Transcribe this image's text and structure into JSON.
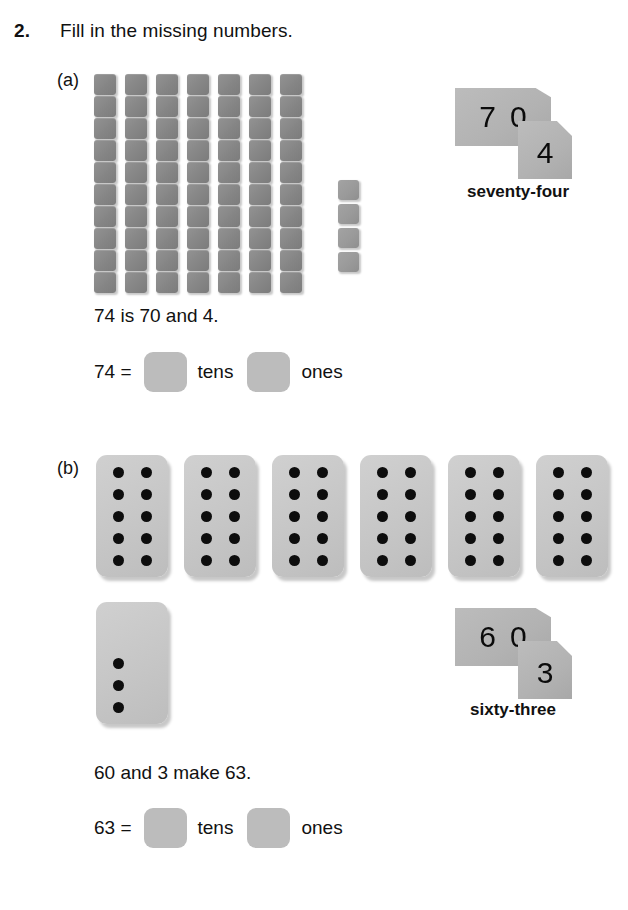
{
  "worksheet": {
    "question_number": "2.",
    "instruction": "Fill in the missing numbers."
  },
  "parts": [
    {
      "label": "(a)",
      "model_type": "base-ten-blocks",
      "tens_rods": 7,
      "cubes_per_rod": 10,
      "ones_blocks": 4,
      "number_card_tens_digit_1": "7",
      "number_card_tens_digit_2": "0",
      "number_card_ones_digit": "4",
      "number_word": "seventy-four",
      "sentence": "74 is 70 and 4.",
      "equation_lead": "74 =",
      "unit_tens": "tens",
      "unit_ones": "ones",
      "answer_tens_value": "",
      "answer_ones_value": ""
    },
    {
      "label": "(b)",
      "model_type": "ten-frame-dot-cards",
      "full_cards": 6,
      "dots_per_full_card": 10,
      "partial_card_dots": 3,
      "number_card_tens_digit_1": "6",
      "number_card_tens_digit_2": "0",
      "number_card_ones_digit": "3",
      "number_word": "sixty-three",
      "sentence": "60 and 3 make 63.",
      "equation_lead": "63 =",
      "unit_tens": "tens",
      "unit_ones": "ones",
      "answer_tens_value": "",
      "answer_ones_value": ""
    }
  ],
  "colors": {
    "block_gray": "#8a8a8a",
    "ones_block_gray": "#9a9a9a",
    "number_card_gray": "#b2b2b2",
    "dot_card_gray": "#c6c6c6",
    "answer_box_gray": "#bcbcbc",
    "dot_black": "#0d0d0d",
    "text_black": "#111111",
    "page_background": "#ffffff"
  }
}
